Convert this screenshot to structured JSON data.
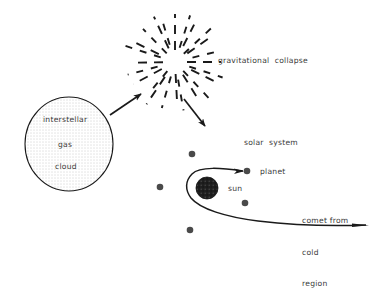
{
  "diagram": {
    "background_color": "#ffffff",
    "ink_color": "#1a1a1a",
    "text_color": "#3a3a3a",
    "labels": {
      "gravitational_collapse": "gravitational  collapse",
      "solar_system": "solar  system",
      "planet": "planet",
      "sun": "sun",
      "comet_line1": "comet from",
      "comet_line2": "cold",
      "comet_line3": "region",
      "cloud_line1": "interstellar",
      "cloud_line2": "gas",
      "cloud_line3": "cloud"
    },
    "shapes": {
      "interstellar_cloud": {
        "type": "ellipse",
        "cx": 69,
        "cy": 144,
        "rx": 44,
        "ry": 47,
        "fill": "stipple-dots",
        "stroke": "#1a1a1a"
      },
      "collapse_burst": {
        "type": "radial-dashes",
        "cx": 175,
        "cy": 62,
        "dash_count": 24,
        "inner_radius": 12,
        "outer_radius": 46
      },
      "sun": {
        "type": "circle",
        "cx": 207,
        "cy": 188,
        "r": 11,
        "fill": "#262626",
        "texture": "speckled"
      },
      "planet_dot": {
        "cx": 247,
        "cy": 171,
        "r": 3.2
      },
      "field_dots": [
        {
          "cx": 192,
          "cy": 154,
          "r": 3.2
        },
        {
          "cx": 160,
          "cy": 187,
          "r": 3.2
        },
        {
          "cx": 245,
          "cy": 203,
          "r": 3.2
        },
        {
          "cx": 190,
          "cy": 230,
          "r": 3.2
        }
      ]
    },
    "arrows": {
      "cloud_to_collapse": {
        "from": [
          110,
          114
        ],
        "to": [
          140,
          94
        ]
      },
      "collapse_to_system": {
        "from": [
          185,
          100
        ],
        "to": [
          205,
          125
        ]
      },
      "orbit_to_planet": {
        "to": [
          244,
          171
        ]
      },
      "comet_tail_end": {
        "to": [
          369,
          225
        ]
      }
    }
  }
}
